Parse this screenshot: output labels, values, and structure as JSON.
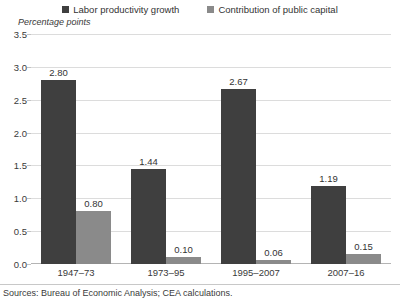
{
  "legend": {
    "items": [
      {
        "label": "Labor productivity growth",
        "color": "#3f3f3f",
        "swatch_name": "legend-swatch-primary"
      },
      {
        "label": "Contribution of public capital",
        "color": "#8a8a8a",
        "swatch_name": "legend-swatch-secondary"
      }
    ]
  },
  "axis_title": "Percentage points",
  "source_note": "Sources: Bureau of Economic Analysis; CEA calculations.",
  "yticks": [
    "0.0",
    "0.5",
    "1.0",
    "1.5",
    "2.0",
    "2.5",
    "3.0",
    "3.5"
  ],
  "chart_data": {
    "type": "bar",
    "title": "",
    "subtitle": "",
    "xlabel": "",
    "ylabel": "Percentage points",
    "ylim": [
      0,
      3.5
    ],
    "ytick_values": [
      0.0,
      0.5,
      1.0,
      1.5,
      2.0,
      2.5,
      3.0,
      3.5
    ],
    "ytick_labels": [
      "0.0",
      "0.5",
      "1.0",
      "1.5",
      "2.0",
      "2.5",
      "3.0",
      "3.5"
    ],
    "grid": "horizontal",
    "legend_position": "top-center",
    "categories": [
      "1947–73",
      "1973–95",
      "1995–2007",
      "2007–16"
    ],
    "series": [
      {
        "name": "Labor productivity growth",
        "color": "#3f3f3f",
        "values": [
          2.8,
          1.44,
          2.67,
          1.19
        ],
        "labels": [
          "2.80",
          "1.44",
          "2.67",
          "1.19"
        ]
      },
      {
        "name": "Contribution of public capital",
        "color": "#8a8a8a",
        "values": [
          0.8,
          0.1,
          0.06,
          0.15
        ],
        "labels": [
          "0.80",
          "0.10",
          "0.06",
          "0.15"
        ]
      }
    ],
    "annotations": [
      "Sources: Bureau of Economic Analysis; CEA calculations."
    ]
  }
}
